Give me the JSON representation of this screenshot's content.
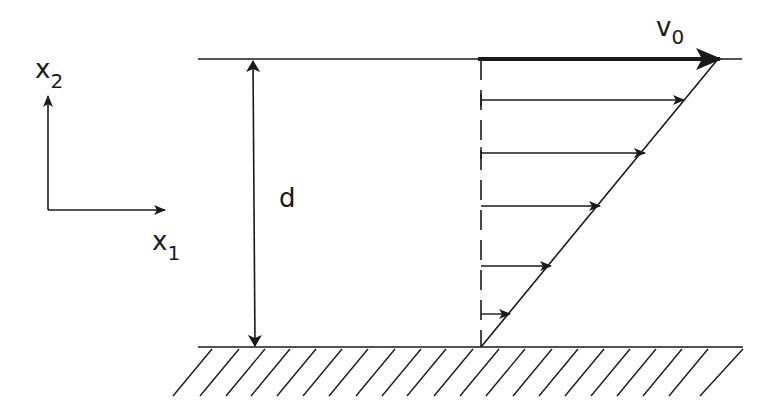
{
  "diagram": {
    "colors": {
      "ink": "#1a1a1a",
      "background": "#ffffff"
    },
    "axes": {
      "x_label": "x",
      "x_sub": "1",
      "y_label": "x",
      "y_sub": "2"
    },
    "gap": {
      "label": "d"
    },
    "plate_velocity": {
      "label": "v",
      "sub": "0"
    },
    "velocity_profile": {
      "type": "linear",
      "arrows_y": [
        100,
        153,
        206,
        266,
        314
      ]
    },
    "wall": {
      "type": "fixed",
      "hatched": true
    }
  }
}
